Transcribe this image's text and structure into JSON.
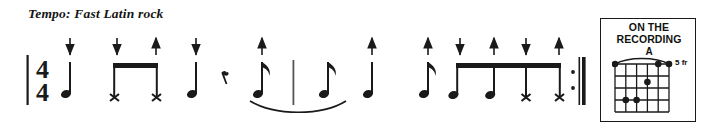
{
  "tempo": {
    "label": "Tempo: Fast Latin rock"
  },
  "notation": {
    "time_signature": {
      "numerator": "4",
      "denominator": "4"
    },
    "barline_start": "barline-thin",
    "barline_middle": "barline-thin",
    "barline_end": "repeat-end",
    "strum_arrow_down": "down",
    "strum_arrow_up": "up",
    "events": [
      {
        "id": "n1",
        "x": 66,
        "type": "quarter-note",
        "notehead": "normal",
        "arrow": "down",
        "beam": null
      },
      {
        "id": "n2",
        "x": 117,
        "type": "eighth-note",
        "notehead": "x",
        "arrow": "down",
        "beam": "beam-1"
      },
      {
        "id": "n3",
        "x": 152,
        "type": "eighth-note",
        "notehead": "x",
        "arrow": "up",
        "beam": "beam-1"
      },
      {
        "id": "n4",
        "x": 192,
        "type": "quarter-note",
        "notehead": "normal",
        "arrow": "down",
        "beam": null
      },
      {
        "id": "r1",
        "x": 224,
        "type": "eighth-rest",
        "notehead": null,
        "arrow": null,
        "beam": null
      },
      {
        "id": "n5",
        "x": 256,
        "type": "eighth-note",
        "notehead": "normal",
        "arrow": "up",
        "beam": null
      },
      {
        "id": "n6",
        "x": 322,
        "type": "eighth-note",
        "notehead": "normal",
        "arrow": null,
        "beam": null
      },
      {
        "id": "n7",
        "x": 368,
        "type": "quarter-note",
        "notehead": "normal",
        "arrow": "up",
        "beam": null
      },
      {
        "id": "n8",
        "x": 424,
        "type": "eighth-note",
        "notehead": "normal",
        "arrow": "up",
        "beam": null
      },
      {
        "id": "n9",
        "x": 460,
        "type": "eighth-note",
        "notehead": "normal",
        "arrow": "down",
        "beam": "beam-2"
      },
      {
        "id": "n10",
        "x": 493,
        "type": "eighth-note",
        "notehead": "normal",
        "arrow": "up",
        "beam": "beam-2"
      },
      {
        "id": "n11",
        "x": 524,
        "type": "eighth-note",
        "notehead": "x",
        "arrow": "down",
        "beam": "beam-2"
      },
      {
        "id": "n12",
        "x": 556,
        "type": "eighth-note",
        "notehead": "x",
        "arrow": "up",
        "beam": "beam-2"
      }
    ],
    "beams": [
      {
        "id": "beam-1",
        "x1": 113,
        "x2": 156
      },
      {
        "id": "beam-2",
        "x1": 456,
        "x2": 560
      }
    ],
    "slur": {
      "from": "n5",
      "to": "n6",
      "x1": 250,
      "x2": 346,
      "direction": "below"
    }
  },
  "chord_diagram": {
    "header_line1": "ON THE",
    "header_line2": "RECORDING",
    "chord_name": "A",
    "fret_label": "5 fr",
    "strings": 6,
    "frets": 4,
    "barre": {
      "from_string": 1,
      "to_string": 6,
      "fret": 1
    },
    "dots": [
      {
        "string": 1,
        "fret": 1
      },
      {
        "string": 5,
        "fret": 1
      },
      {
        "string": 6,
        "fret": 1
      },
      {
        "string": 4,
        "fret": 2
      },
      {
        "string": 2,
        "fret": 3
      },
      {
        "string": 3,
        "fret": 3
      }
    ]
  },
  "colors": {
    "ink": "#1a1a1a",
    "paper": "#ffffff"
  }
}
